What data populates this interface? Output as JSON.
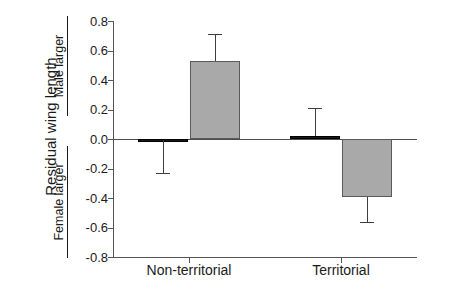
{
  "chart_data": {
    "type": "bar",
    "title": "",
    "xlabel": "",
    "ylabel": "Residual wing length",
    "ylim": [
      -0.8,
      0.8
    ],
    "ytick_labels": [
      "0.8",
      "0.6",
      "0.4",
      "0.2",
      "0.0",
      "-0.2",
      "-0.4",
      "-0.6",
      "-0.8"
    ],
    "ytick_values": [
      0.8,
      0.6,
      0.4,
      0.2,
      0.0,
      -0.2,
      -0.4,
      -0.6,
      -0.8
    ],
    "grid": false,
    "legend": "none",
    "axis_direction_labels": {
      "positive": "Male larger",
      "negative": "Female larger"
    },
    "categories": [
      "Non-territorial",
      "Territorial"
    ],
    "series": [
      {
        "name": "series-1",
        "color": "#161616",
        "values": [
          -0.01,
          0.02
        ],
        "errors": [
          0.23,
          0.19
        ]
      },
      {
        "name": "series-2",
        "color": "#a9a9a9",
        "values": [
          0.53,
          -0.39
        ],
        "errors": [
          0.18,
          0.18
        ]
      }
    ]
  },
  "axis": {
    "zero_value": "0.0"
  }
}
